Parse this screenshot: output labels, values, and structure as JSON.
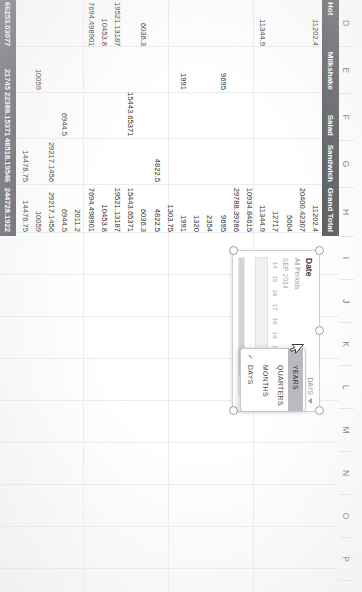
{
  "application": {
    "name": "spreadsheet",
    "sheet_grid": {
      "column_headers": [
        "D",
        "E",
        "F",
        "G",
        "H",
        "I",
        "J",
        "K",
        "L",
        "M",
        "N",
        "O",
        "P"
      ]
    }
  },
  "pivot_table": {
    "header_row": {
      "row_label": "Hot",
      "columns": [
        "Milkshake",
        "Salad",
        "Sandwich",
        "Grand Total"
      ]
    },
    "grand_total_row": {
      "cells": [
        "66253.03077",
        "21745",
        "22388.15371",
        "48518.19546",
        "244728.1922"
      ]
    },
    "rows": [
      {
        "hot": "11202.4",
        "milkshake": "",
        "salad": "",
        "sandwich": "",
        "grand_total": "11202.4"
      },
      {
        "hot": "",
        "milkshake": "",
        "salad": "",
        "sandwich": "",
        "grand_total": "20400.42307"
      },
      {
        "hot": "",
        "milkshake": "",
        "salad": "",
        "sandwich": "",
        "grand_total": "5004"
      },
      {
        "hot": "",
        "milkshake": "",
        "salad": "",
        "sandwich": "",
        "grand_total": "12717"
      },
      {
        "hot": "11344.9",
        "milkshake": "",
        "salad": "",
        "sandwich": "",
        "grand_total": "11344.9"
      },
      {
        "hot": "",
        "milkshake": "",
        "salad": "",
        "sandwich": "",
        "grand_total": "10934.84615"
      },
      {
        "hot": "",
        "milkshake": "",
        "salad": "",
        "sandwich": "",
        "grand_total": "29788.39286"
      },
      {
        "hot": "",
        "milkshake": "9695",
        "salad": "",
        "sandwich": "",
        "grand_total": "9695"
      },
      {
        "hot": "",
        "milkshake": "",
        "salad": "",
        "sandwich": "",
        "grand_total": "2354"
      },
      {
        "hot": "",
        "milkshake": "",
        "salad": "",
        "sandwich": "",
        "grand_total": "1320"
      },
      {
        "hot": "",
        "milkshake": "1991",
        "salad": "",
        "sandwich": "",
        "grand_total": "1991"
      },
      {
        "hot": "",
        "milkshake": "",
        "salad": "",
        "sandwich": "",
        "grand_total": "1303.75"
      },
      {
        "hot": "",
        "milkshake": "",
        "salad": "",
        "sandwich": "4822.5",
        "grand_total": "4822.5"
      },
      {
        "hot": "6036.3",
        "milkshake": "",
        "salad": "",
        "sandwich": "",
        "grand_total": "6036.3"
      },
      {
        "hot": "",
        "milkshake": "",
        "salad": "15443.65371",
        "sandwich": "",
        "grand_total": "15443.65371"
      },
      {
        "hot": "19521.13187",
        "milkshake": "",
        "salad": "",
        "sandwich": "",
        "grand_total": "19521.13187"
      },
      {
        "hot": "10453.8",
        "milkshake": "",
        "salad": "",
        "sandwich": "",
        "grand_total": "10453.8"
      },
      {
        "hot": "7694.498901",
        "milkshake": "",
        "salad": "",
        "sandwich": "",
        "grand_total": "7694.498901"
      },
      {
        "hot": "",
        "milkshake": "",
        "salad": "",
        "sandwich": "",
        "grand_total": "2011.2"
      },
      {
        "hot": "",
        "milkshake": "",
        "salad": "6944.5",
        "sandwich": "",
        "grand_total": "6944.5"
      },
      {
        "hot": "",
        "milkshake": "",
        "salad": "",
        "sandwich": "29217.1456",
        "grand_total": "29217.1456"
      },
      {
        "hot": "",
        "milkshake": "10059",
        "salad": "",
        "sandwich": "",
        "grand_total": "10059"
      },
      {
        "hot": "",
        "milkshake": "",
        "salad": "",
        "sandwich": "14478.75",
        "grand_total": "14478.75"
      }
    ]
  },
  "timeline_slicer": {
    "title": "Date",
    "subtitle": "All Periods",
    "level_label": "DAYS",
    "period_label": "SEP 2014",
    "ticks": [
      "14",
      "15",
      "16",
      "17",
      "18",
      "19",
      "20",
      "21",
      "22",
      "23"
    ],
    "selection_start_tick": "21",
    "selection_end_tick": "23",
    "level_menu": {
      "items": [
        {
          "label": "YEARS",
          "checked": false,
          "selected": true
        },
        {
          "label": "QUARTERS",
          "checked": false,
          "selected": false
        },
        {
          "label": "MONTHS",
          "checked": false,
          "selected": false
        },
        {
          "label": "DAYS",
          "checked": true,
          "selected": false
        }
      ]
    }
  },
  "colors": {
    "header_band": "#595a5e",
    "selection_fill": "#c9c9ce",
    "menu_selected": "#b8b8bd",
    "grid_line": "#ececed"
  }
}
